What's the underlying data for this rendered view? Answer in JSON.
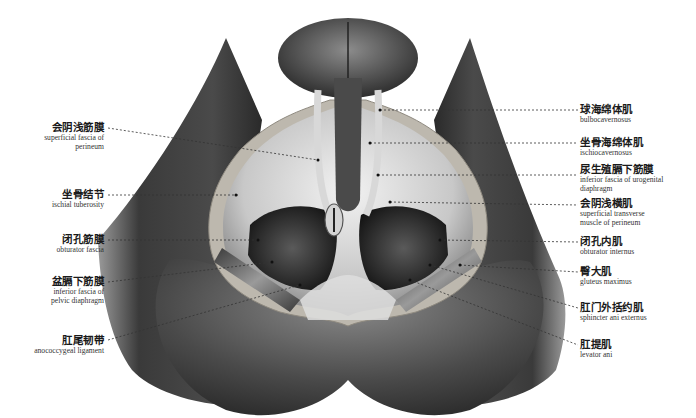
{
  "figure": {
    "colors": {
      "skin_dark": "#2b2b2b",
      "skin_mid": "#6a6a6a",
      "tissue_light": "#e8e8e8",
      "fat_rim": "#bdb9b2",
      "leader_line": "#333333"
    }
  },
  "labels_left": [
    {
      "zh": "会阴浅筋膜",
      "en": "superficial fascia of perineum",
      "en_lines": [
        "superficial fascia of",
        "perineum"
      ]
    },
    {
      "zh": "坐骨结节",
      "en": "ischial tuberosity",
      "en_lines": [
        "ischial tuberosity"
      ]
    },
    {
      "zh": "闭孔筋膜",
      "en": "obturator fascia",
      "en_lines": [
        "obturator fascia"
      ]
    },
    {
      "zh": "盆膈下筋膜",
      "en": "inferior fascia of pelvic diaphragm",
      "en_lines": [
        "inferior fascia of",
        "pelvic diaphragm"
      ]
    },
    {
      "zh": "肛尾韧带",
      "en": "anococcygeal ligament",
      "en_lines": [
        "anococcygeal ligament"
      ]
    }
  ],
  "labels_right": [
    {
      "zh": "球海绵体肌",
      "en": "bulbocavernosus",
      "en_lines": [
        "bulbocavernosus"
      ]
    },
    {
      "zh": "坐骨海绵体肌",
      "en": "ischiocavernosus",
      "en_lines": [
        "ischiocavernosus"
      ]
    },
    {
      "zh": "尿生殖膈下筋膜",
      "en": "inferior fascia of urogenital diaphragm",
      "en_lines": [
        "inferior fascia of urogenital",
        "diaphragm"
      ]
    },
    {
      "zh": "会阴浅横肌",
      "en": "superficial transverse muscle of perineum",
      "en_lines": [
        "superficial transverse",
        "muscle of perineum"
      ]
    },
    {
      "zh": "闭孔内肌",
      "en": "obturator internus",
      "en_lines": [
        "obturator internus"
      ]
    },
    {
      "zh": "臀大肌",
      "en": "gluteus maximus",
      "en_lines": [
        "gluteus maximus"
      ]
    },
    {
      "zh": "肛门外括约肌",
      "en": "sphincter ani externus",
      "en_lines": [
        "sphincter ani externus"
      ]
    },
    {
      "zh": "肛提肌",
      "en": "levator ani",
      "en_lines": [
        "levator ani"
      ]
    }
  ]
}
